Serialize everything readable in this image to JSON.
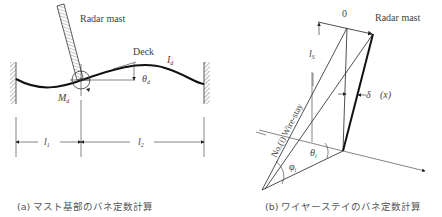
{
  "figure_a": {
    "mast_label": "Radar mast",
    "deck_label": "Deck",
    "inertia_label": "I",
    "inertia_sub": "d",
    "theta_label": "θ",
    "theta_sub": "d",
    "moment_label": "M",
    "moment_sub": "d",
    "span1_label": "l",
    "span1_sub": "1",
    "span2_label": "l",
    "span2_sub": "2",
    "caption": "(a) マスト基部のバネ定数計算"
  },
  "figure_b": {
    "origin_label": "0",
    "mast_label": "Radar mast",
    "height_label": "l",
    "height_sub": "S",
    "wire_label": "No.(i) Wire-stay",
    "delta_label": "δ",
    "x_label": "(x)",
    "phi_label": "φ",
    "phi_sub": "i",
    "theta_label": "θ",
    "theta_sub": "i",
    "caption": "(b) ワイヤーステイのバネ定数計算"
  },
  "colors": {
    "line": "#222222",
    "hatch": "#888888",
    "text": "#444444"
  }
}
